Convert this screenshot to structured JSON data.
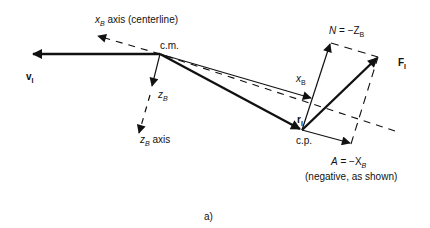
{
  "figure": {
    "panel_label": "a)",
    "colors": {
      "ink": "#111111",
      "background": "#ffffff"
    }
  },
  "labels": {
    "xb_axis": {
      "var": "x",
      "sub": "B",
      "text": " axis (centerline)"
    },
    "cm": "c.m.",
    "v": {
      "var": "v",
      "sub": "I"
    },
    "zb_short": {
      "var": "z",
      "sub": "B"
    },
    "zb_axis": {
      "var": "z",
      "sub": "B",
      "text": " axis"
    },
    "normal": {
      "lhs": "N",
      "eq": " = −Z",
      "sub": "B"
    },
    "force": {
      "var": "F",
      "sub": "I"
    },
    "xb_short": {
      "var": "x",
      "sub": "B"
    },
    "r": {
      "var": "r",
      "sub": "I"
    },
    "cp": "c.p.",
    "axial": {
      "lhs": "A",
      "eq": " = −X",
      "sub": "B"
    },
    "axial_note": "(negative, as shown)"
  },
  "points": {
    "cm": [
      160,
      54
    ],
    "cp": [
      302,
      130
    ],
    "v_tip": [
      31,
      54
    ],
    "xb_axis_tip": [
      97,
      36
    ],
    "xb_axis_end": [
      395,
      131
    ],
    "zb_tip": [
      152,
      87
    ],
    "zb_axis_tip": [
      137,
      135
    ],
    "n_tip": [
      331,
      43
    ],
    "f_tip": [
      378,
      57
    ],
    "a_tip": [
      351,
      144
    ]
  }
}
